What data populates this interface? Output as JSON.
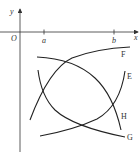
{
  "diagram": {
    "type": "function-graphs",
    "axes": {
      "x_label": "x",
      "y_label": "y",
      "origin_label": "O",
      "x_ticks": [
        "a",
        "b"
      ]
    },
    "curves": [
      {
        "label": "F",
        "shape": "increasing, concave down"
      },
      {
        "label": "E",
        "shape": "increasing, concave up"
      },
      {
        "label": "G",
        "shape": "decreasing, concave up"
      },
      {
        "label": "H",
        "shape": "decreasing, concave down"
      }
    ]
  }
}
